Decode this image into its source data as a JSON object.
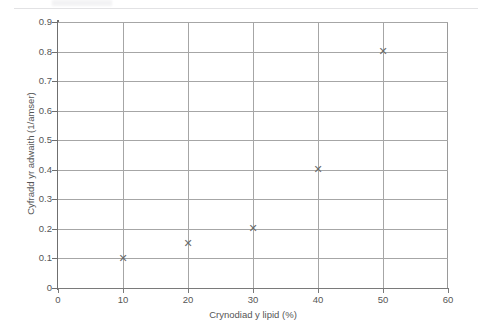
{
  "figure": {
    "background_color": "#ffffff",
    "axis_color": "#6f6f6f",
    "grid_color": "#a6a6a6",
    "marker_color": "#6b6b6b",
    "marker_glyph": "✕",
    "text_color": "#555555"
  },
  "chart_data": {
    "type": "scatter",
    "title": "",
    "xlabel": "Crynodiad y lipid (%)",
    "ylabel": "Cyfradd yr adwaith (1/amser)",
    "xlim": [
      0,
      60
    ],
    "ylim": [
      0,
      0.9
    ],
    "xticks": [
      "0",
      "10",
      "20",
      "30",
      "40",
      "50",
      "60"
    ],
    "xtick_values": [
      0,
      10,
      20,
      30,
      40,
      50,
      60
    ],
    "yticks": [
      "0",
      "0.1",
      "0.2",
      "0.3",
      "0.4",
      "0.5",
      "0.6",
      "0.7",
      "0.8",
      "0.9"
    ],
    "ytick_values": [
      0,
      0.1,
      0.2,
      0.3,
      0.4,
      0.5,
      0.6,
      0.7,
      0.8,
      0.9
    ],
    "grid": true,
    "legend": null,
    "x": [
      10,
      20,
      30,
      40,
      50
    ],
    "y": [
      0.1,
      0.15,
      0.2,
      0.4,
      0.8
    ],
    "points": [
      {
        "x": 10,
        "y": 0.1
      },
      {
        "x": 20,
        "y": 0.15
      },
      {
        "x": 30,
        "y": 0.2
      },
      {
        "x": 40,
        "y": 0.4
      },
      {
        "x": 50,
        "y": 0.8
      }
    ]
  }
}
